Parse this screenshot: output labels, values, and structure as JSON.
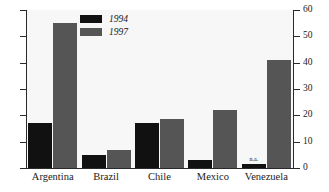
{
  "chart_data": {
    "type": "bar",
    "title": "",
    "subtitle": "",
    "xlabel": "",
    "ylabel": "",
    "categories": [
      "Argentina",
      "Brazil",
      "Chile",
      "Mexico",
      "Venezuela"
    ],
    "series": [
      {
        "name": "1994",
        "color": "#111111",
        "values": [
          17,
          5,
          17,
          3,
          1.5
        ]
      },
      {
        "name": "1997",
        "color": "#555555",
        "values": [
          55,
          7,
          18.5,
          22,
          41
        ]
      }
    ],
    "annotations": [
      {
        "text": "n.a.",
        "category": "Venezuela",
        "series": "1994"
      }
    ],
    "ylim": [
      0,
      60
    ],
    "yticks": [
      0,
      10,
      20,
      30,
      40,
      50,
      60
    ],
    "ytick_labels": [
      "0",
      "10",
      "20",
      "30",
      "40",
      "50",
      "60"
    ],
    "y_axis_position": "right",
    "left_axis_ticks_unlabeled": true,
    "grid": false,
    "legend_position": "upper-left-inside",
    "plot_background": "#f7f7f7"
  },
  "legend": {
    "items": [
      {
        "label": "1994"
      },
      {
        "label": "1997"
      }
    ]
  },
  "axis": {
    "right_labels": [
      "60",
      "50",
      "40",
      "30",
      "20",
      "10",
      "0"
    ]
  },
  "categories": {
    "labels": [
      "Argentina",
      "Brazil",
      "Chile",
      "Mexico",
      "Venezuela"
    ]
  },
  "annotation": {
    "na": "n.a."
  }
}
